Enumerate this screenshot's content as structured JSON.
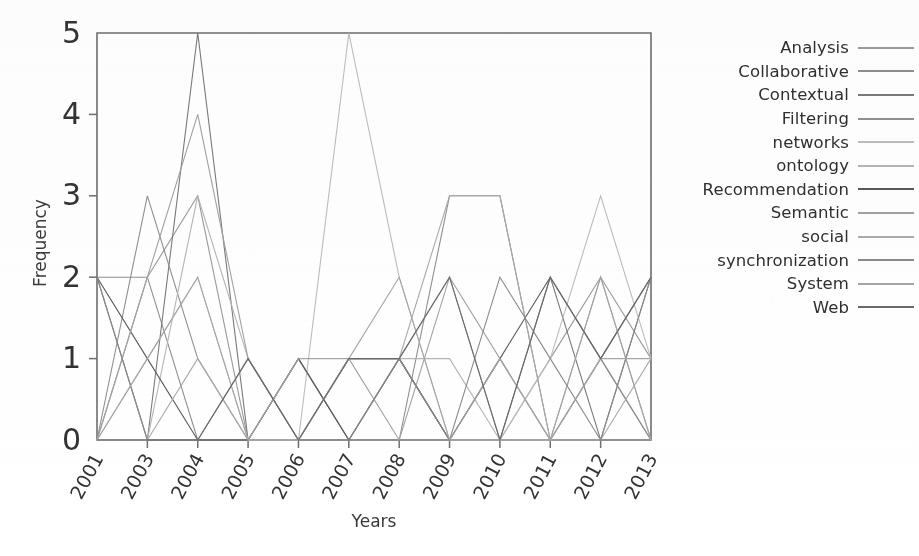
{
  "figure": {
    "background_color": "#ffffff",
    "axis_color": "#6e6e6e"
  },
  "axes": {
    "xlabel": "Years",
    "ylabel": "Frequency",
    "ytick_labels": [
      "0",
      "1",
      "2",
      "3",
      "4",
      "5"
    ],
    "xtick_labels": [
      "2001",
      "2003",
      "2004",
      "2005",
      "2006",
      "2007",
      "2008",
      "2009",
      "2010",
      "2011",
      "2012",
      "2013"
    ]
  },
  "legend": {
    "position": "right",
    "entries": [
      {
        "label": "Analysis",
        "color": "#9a9a9a"
      },
      {
        "label": "Collaborative",
        "color": "#8e8e8e"
      },
      {
        "label": "Contextual",
        "color": "#7a7a7a"
      },
      {
        "label": "Filtering",
        "color": "#909090"
      },
      {
        "label": "networks",
        "color": "#bdbdbd"
      },
      {
        "label": "ontology",
        "color": "#b5b5b5"
      },
      {
        "label": "Recommendation",
        "color": "#5a5a5a"
      },
      {
        "label": "Semantic",
        "color": "#a2a2a2"
      },
      {
        "label": "social",
        "color": "#aaaaaa"
      },
      {
        "label": "synchronization",
        "color": "#8a8a8a"
      },
      {
        "label": "System",
        "color": "#a6a6a6"
      },
      {
        "label": "Web",
        "color": "#6a6a6a"
      }
    ]
  },
  "chart_data": {
    "type": "line",
    "title": "",
    "xlabel": "Years",
    "ylabel": "Frequency",
    "ylim": [
      0,
      5
    ],
    "yticks": [
      0,
      1,
      2,
      3,
      4,
      5
    ],
    "grid": false,
    "legend_position": "right",
    "categories": [
      "2001",
      "2003",
      "2004",
      "2005",
      "2006",
      "2007",
      "2008",
      "2009",
      "2010",
      "2011",
      "2012",
      "2013"
    ],
    "series": [
      {
        "name": "Analysis",
        "color": "#9a9a9a",
        "values": [
          0,
          2,
          3,
          0,
          1,
          0,
          1,
          2,
          0,
          1,
          2,
          1
        ]
      },
      {
        "name": "Collaborative",
        "color": "#8e8e8e",
        "values": [
          2,
          2,
          0,
          0,
          0,
          1,
          1,
          0,
          1,
          0,
          1,
          0
        ]
      },
      {
        "name": "Contextual",
        "color": "#7a7a7a",
        "values": [
          2,
          0,
          5,
          0,
          0,
          1,
          1,
          0,
          0,
          2,
          0,
          2
        ]
      },
      {
        "name": "Filtering",
        "color": "#909090",
        "values": [
          0,
          3,
          1,
          0,
          1,
          0,
          0,
          3,
          3,
          0,
          1,
          0
        ]
      },
      {
        "name": "networks",
        "color": "#bdbdbd",
        "values": [
          0,
          1,
          2,
          0,
          0,
          5,
          2,
          0,
          0,
          1,
          3,
          1
        ]
      },
      {
        "name": "ontology",
        "color": "#b5b5b5",
        "values": [
          0,
          0,
          3,
          1,
          0,
          1,
          1,
          1,
          0,
          0,
          2,
          0
        ]
      },
      {
        "name": "Recommendation",
        "color": "#5a5a5a",
        "values": [
          2,
          1,
          0,
          0,
          1,
          0,
          1,
          0,
          1,
          2,
          1,
          2
        ]
      },
      {
        "name": "Semantic",
        "color": "#a2a2a2",
        "values": [
          0,
          2,
          4,
          1,
          0,
          1,
          0,
          2,
          1,
          0,
          2,
          0
        ]
      },
      {
        "name": "social",
        "color": "#aaaaaa",
        "values": [
          0,
          0,
          1,
          0,
          0,
          1,
          1,
          3,
          3,
          0,
          0,
          1
        ]
      },
      {
        "name": "synchronization",
        "color": "#8a8a8a",
        "values": [
          2,
          0,
          0,
          1,
          0,
          0,
          1,
          0,
          2,
          1,
          0,
          2
        ]
      },
      {
        "name": "System",
        "color": "#a6a6a6",
        "values": [
          0,
          1,
          2,
          0,
          1,
          1,
          2,
          0,
          1,
          0,
          1,
          1
        ]
      },
      {
        "name": "Web",
        "color": "#6a6a6a",
        "values": [
          0,
          0,
          0,
          1,
          0,
          1,
          1,
          2,
          0,
          2,
          1,
          2
        ]
      }
    ]
  }
}
